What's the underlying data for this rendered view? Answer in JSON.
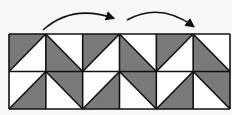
{
  "diagram": {
    "type": "tessellation-pattern",
    "grid": {
      "rows": 2,
      "cols": 6,
      "x": 9,
      "y": 34,
      "width": 221,
      "height": 75
    },
    "colors": {
      "fill_dark": "#7a7a7a",
      "fill_light": "#ffffff",
      "stroke": "#111111",
      "background": "#f7f7f5"
    },
    "cells": [
      [
        {
          "diag": "up",
          "shade": "upper-left"
        },
        {
          "diag": "down",
          "shade": "lower-left"
        },
        {
          "diag": "up",
          "shade": "upper-left"
        },
        {
          "diag": "down",
          "shade": "lower-left"
        },
        {
          "diag": "up",
          "shade": "upper-left"
        },
        {
          "diag": "down",
          "shade": "lower-left"
        }
      ],
      [
        {
          "diag": "up",
          "shade": "lower-right"
        },
        {
          "diag": "down",
          "shade": "upper-right"
        },
        {
          "diag": "up",
          "shade": "lower-right"
        },
        {
          "diag": "down",
          "shade": "upper-right"
        },
        {
          "diag": "up",
          "shade": "lower-right"
        },
        {
          "diag": "down",
          "shade": "upper-right"
        }
      ]
    ],
    "arrows": [
      {
        "name": "translation-arrow-1",
        "from": [
          43,
          30
        ],
        "ctrl": [
          72,
          4
        ],
        "to": [
          113,
          18
        ]
      },
      {
        "name": "translation-arrow-2",
        "from": [
          127,
          20
        ],
        "ctrl": [
          160,
          2
        ],
        "to": [
          193,
          26
        ]
      }
    ]
  }
}
